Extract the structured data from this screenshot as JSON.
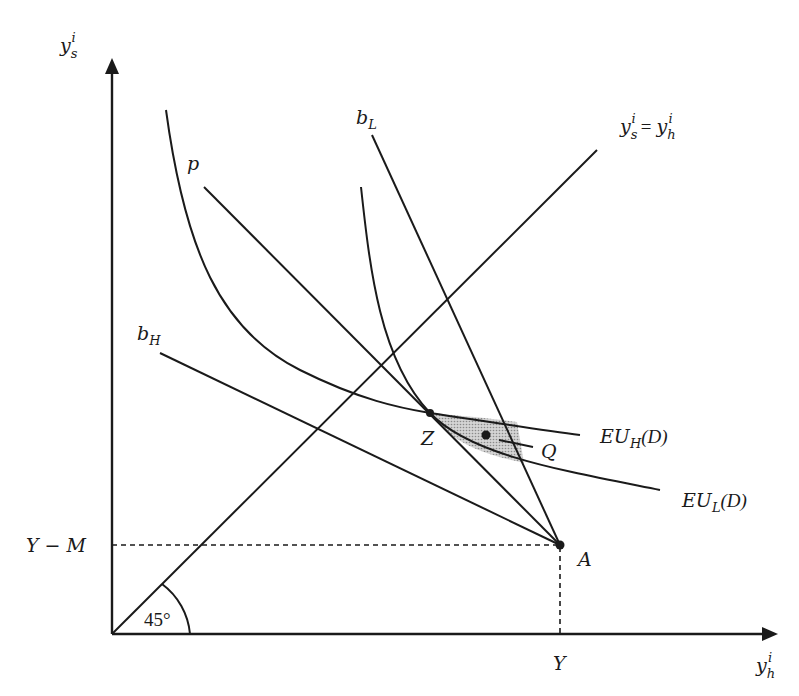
{
  "diagram": {
    "axes": {
      "y_label": "y",
      "y_sub": "s",
      "y_sup": "i",
      "x_label": "y",
      "x_sub": "h",
      "x_sup": "i"
    },
    "lines": {
      "certainty_line": {
        "lhs": "y",
        "lhs_sub": "s",
        "sup": "i",
        "eq": "=",
        "rhs": "y",
        "rhs_sub": "h",
        "rhs_sup": "i"
      },
      "b_L": {
        "main": "b",
        "sub": "L"
      },
      "b_H": {
        "main": "b",
        "sub": "H"
      },
      "p": {
        "main": "p"
      }
    },
    "curves": {
      "EU_H": {
        "main": "EU",
        "sub": "H",
        "arg": "(D)"
      },
      "EU_L": {
        "main": "EU",
        "sub": "L",
        "arg": "(D)"
      }
    },
    "points": {
      "A": "A",
      "Z": "Z",
      "Q": "Q"
    },
    "ticks": {
      "y_tick": "Y − M",
      "x_tick": "Y"
    },
    "angle_label": "45°",
    "colors": {
      "ink": "#1a1a1a",
      "shade": "#bdbdbd"
    }
  }
}
